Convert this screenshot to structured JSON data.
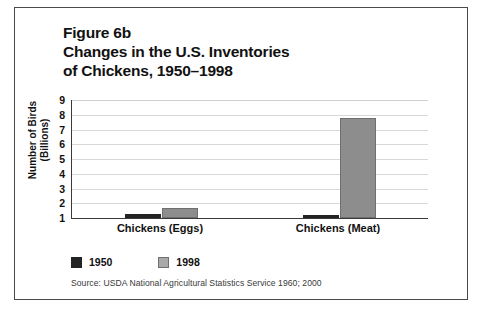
{
  "figure": {
    "title_lines": [
      "Figure 6b",
      "Changes in the U.S. Inventories",
      "of Chickens, 1950–1998"
    ],
    "source_note": "Source: USDA National Agricultural Statistics Service 1960; 2000"
  },
  "colors": {
    "series_1950": "#232323",
    "series_1998": "#8d8d8d",
    "gridline": "#d8d8d8",
    "axis": "#3a3a3a",
    "frame": "#4a4a4a",
    "text": "#111111"
  },
  "chart_data": {
    "type": "bar",
    "title": "Figure 6b Changes in the U.S. Inventories of Chickens, 1950–1998",
    "subtitle": "",
    "xlabel": "",
    "ylabel_lines": [
      "Number of Birds",
      "(Billions)"
    ],
    "ylabel": "Number of Birds (Billions)",
    "categories": [
      "Chickens (Eggs)",
      "Chickens (Meat)"
    ],
    "series": [
      {
        "name": "1950",
        "color": "#232323",
        "values": [
          1.3,
          1.2
        ]
      },
      {
        "name": "1998",
        "color": "#8d8d8d",
        "values": [
          1.7,
          7.8
        ]
      }
    ],
    "ylim": [
      1,
      9
    ],
    "yticks": [
      9,
      8,
      7,
      6,
      5,
      4,
      3,
      2,
      1
    ],
    "ytick_labels": [
      "9",
      "8",
      "7",
      "6",
      "5",
      "4",
      "3",
      "2",
      "1"
    ],
    "grid": true,
    "legend_position": "bottom-left",
    "legend_entries": [
      "1950",
      "1998"
    ],
    "annotations": [
      "Source: USDA National Agricultural Statistics Service 1960; 2000"
    ],
    "units": "billions of birds"
  }
}
